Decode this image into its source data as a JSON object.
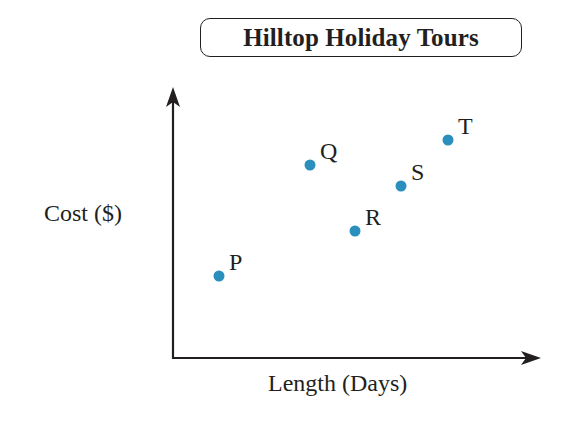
{
  "title": "Hilltop Holiday Tours",
  "axes": {
    "xlabel": "Length (Days)",
    "ylabel": "Cost ($)"
  },
  "colors": {
    "point": "#2a8fbd",
    "axis": "#231f20"
  },
  "chart_data": {
    "type": "scatter",
    "title": "Hilltop Holiday Tours",
    "xlabel": "Length (Days)",
    "ylabel": "Cost ($)",
    "grid": false,
    "legend": null,
    "ticks": "none (unlabeled axes)",
    "points": [
      {
        "label": "P",
        "x": 1.0,
        "y": 1.0
      },
      {
        "label": "Q",
        "x": 3.0,
        "y": 3.4
      },
      {
        "label": "R",
        "x": 4.0,
        "y": 2.0
      },
      {
        "label": "S",
        "x": 5.0,
        "y": 3.0
      },
      {
        "label": "T",
        "x": 6.0,
        "y": 4.0
      }
    ],
    "xlim": [
      0,
      8
    ],
    "ylim": [
      0,
      6
    ],
    "note": "Values are relative positions; axes carry no numeric scale."
  },
  "plot": {
    "points": [
      {
        "label": "P",
        "px": 219,
        "py": 276
      },
      {
        "label": "Q",
        "px": 310,
        "py": 165
      },
      {
        "label": "R",
        "px": 355,
        "py": 231
      },
      {
        "label": "S",
        "px": 401,
        "py": 186
      },
      {
        "label": "T",
        "px": 448,
        "py": 140
      }
    ]
  }
}
